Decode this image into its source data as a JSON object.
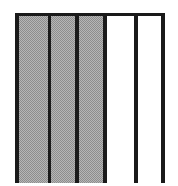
{
  "figure": {
    "caption": "",
    "background_color": "#ffffff",
    "frame": {
      "rule_color": "#1a1a1a",
      "top_rule_height_px": 3,
      "left_px": 15,
      "top_px": 13,
      "width_px": 150,
      "height_px": 170,
      "bottom_cropped": true
    }
  },
  "chart_data": {
    "type": "bar",
    "title": "",
    "subtitle": "",
    "xlabel": "",
    "ylabel": "",
    "categories": [
      "1",
      "2",
      "3",
      "4",
      "5"
    ],
    "values": [
      100,
      100,
      100,
      100,
      100
    ],
    "ylim": [
      0,
      100
    ],
    "grid": false,
    "legend_position": "none",
    "orientation": "vertical",
    "annotations": [],
    "tick_labels": {
      "x": [],
      "y": []
    },
    "series": [
      {
        "name": "bars",
        "values": [
          100,
          100,
          100,
          100,
          100
        ]
      }
    ],
    "bars": [
      {
        "index": 1,
        "fill": "hatch-50-gray",
        "color": "#b6b6b6",
        "width_px": 30,
        "value": 100
      },
      {
        "index": 2,
        "fill": "hatch-50-gray",
        "color": "#b6b6b6",
        "width_px": 25,
        "value": 100
      },
      {
        "index": 3,
        "fill": "hatch-50-gray",
        "color": "#b6b6b6",
        "width_px": 24,
        "value": 100
      },
      {
        "index": 4,
        "fill": "solid-white",
        "color": "#ffffff",
        "width_px": 28,
        "value": 100
      },
      {
        "index": 5,
        "fill": "solid-white",
        "color": "#ffffff",
        "width_px": 24,
        "value": 100
      }
    ],
    "dividers": {
      "color": "#1a1a1a",
      "widths_px": [
        4,
        3,
        4,
        4,
        4,
        4
      ],
      "count": 6
    },
    "colors": {
      "hatch_fill": "#b6b6b6",
      "hatch_dot": "#8d8d8d",
      "white_fill": "#ffffff",
      "rule": "#1a1a1a"
    }
  }
}
